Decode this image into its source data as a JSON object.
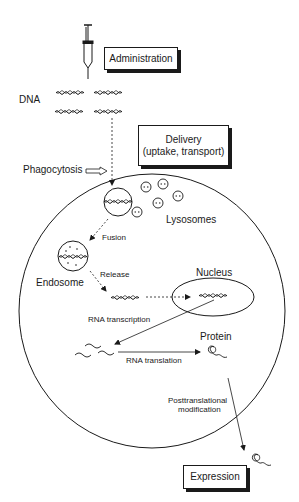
{
  "diagram": {
    "boxes": {
      "administration": "Administration",
      "delivery_line1": "Delivery",
      "delivery_line2": "(uptake, transport)",
      "expression": "Expression"
    },
    "labels": {
      "dna": "DNA",
      "phagocytosis": "Phagocytosis",
      "lysosomes": "Lysosomes",
      "fusion": "Fusion",
      "endosome": "Endosome",
      "release": "Release",
      "nucleus": "Nucleus",
      "rna_transcription": "RNA transcription",
      "protein": "Protein",
      "rna_translation": "RNA translation",
      "posttranslational_line1": "Posttranslational",
      "posttranslational_line2": "modification"
    },
    "colors": {
      "ink": "#1a1a1a",
      "background": "#ffffff"
    }
  }
}
